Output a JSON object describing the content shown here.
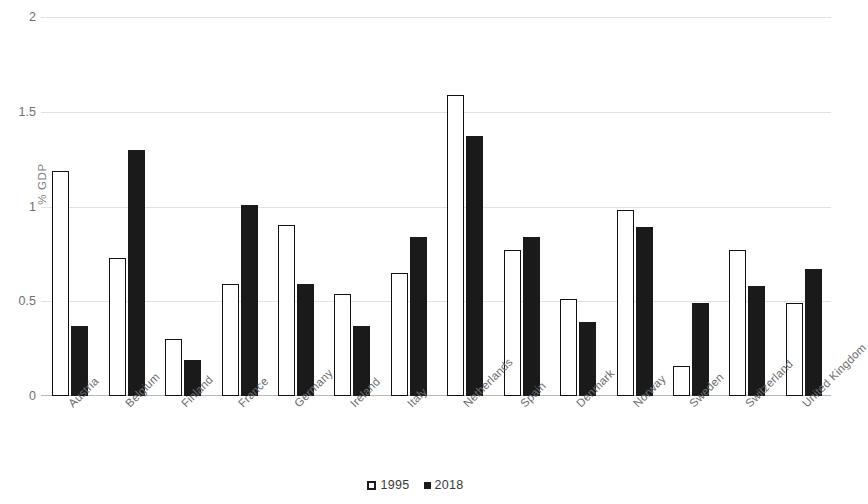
{
  "chart_data": {
    "type": "bar",
    "title": "",
    "xlabel": "",
    "ylabel": "% GDP",
    "ylim": [
      0,
      2
    ],
    "yticks": [
      0,
      0.5,
      1,
      1.5,
      2
    ],
    "ytick_labels": [
      "0",
      "0.5",
      "1",
      "1.5",
      "2"
    ],
    "grid": true,
    "legend_position": "bottom",
    "categories": [
      "Austria",
      "Belgium",
      "Finland",
      "France",
      "Germany",
      "Ireland",
      "Italy",
      "Netherlands",
      "Spain",
      "Denmark",
      "Norway",
      "Sweden",
      "Switzerland",
      "United Kingdom"
    ],
    "series": [
      {
        "name": "1995",
        "color": "#ffffff",
        "edge_color": "#111111",
        "values": [
          1.19,
          0.73,
          0.3,
          0.59,
          0.9,
          0.54,
          0.65,
          1.59,
          0.77,
          0.51,
          0.98,
          0.16,
          0.77,
          0.49
        ]
      },
      {
        "name": "2018",
        "color": "#1a1a1a",
        "edge_color": "#1a1a1a",
        "values": [
          0.37,
          1.3,
          0.19,
          1.01,
          0.59,
          0.37,
          0.84,
          1.37,
          0.84,
          0.39,
          0.89,
          0.49,
          0.58,
          0.67
        ]
      }
    ]
  },
  "axis": {
    "y_title": "% GDP"
  },
  "legend": {
    "items": [
      {
        "label": "1995",
        "marker": "open-square-marker"
      },
      {
        "label": "2018",
        "marker": "filled-square-marker"
      }
    ]
  }
}
